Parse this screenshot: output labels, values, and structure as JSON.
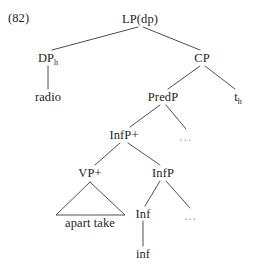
{
  "figure": {
    "example_number": "(82)",
    "width": 258,
    "height": 269,
    "type": "syntax-tree-diagram"
  },
  "nodes": {
    "root": {
      "label": "LP(dp)",
      "x": 140,
      "y": 19
    },
    "dp": {
      "label": "DP",
      "subscript": "h",
      "x": 48,
      "y": 58
    },
    "cp": {
      "label": "CP",
      "x": 202,
      "y": 58
    },
    "radio": {
      "label": "radio",
      "x": 48,
      "y": 97
    },
    "predp": {
      "label": "PredP",
      "x": 163,
      "y": 97
    },
    "trace": {
      "label": "t",
      "subscript": "h",
      "x": 238,
      "y": 97
    },
    "infp_plus": {
      "label": "InfP+",
      "x": 124,
      "y": 135
    },
    "ellipsis_predp": {
      "label": "…",
      "x": 186,
      "y": 137
    },
    "vp_plus": {
      "label": "VP+",
      "x": 90,
      "y": 173
    },
    "infp": {
      "label": "InfP",
      "x": 163,
      "y": 173
    },
    "apart_take": {
      "label": "apart take",
      "x": 90,
      "y": 223
    },
    "inf_head": {
      "label": "Inf",
      "x": 143,
      "y": 214
    },
    "ellipsis_infp": {
      "label": "…",
      "x": 191,
      "y": 216
    },
    "inf_terminal": {
      "label": "inf",
      "x": 143,
      "y": 254
    }
  },
  "edges": [
    {
      "from": "root",
      "to": "dp"
    },
    {
      "from": "root",
      "to": "cp"
    },
    {
      "from": "dp",
      "to": "radio"
    },
    {
      "from": "cp",
      "to": "predp"
    },
    {
      "from": "cp",
      "to": "trace"
    },
    {
      "from": "predp",
      "to": "infp_plus"
    },
    {
      "from": "predp",
      "to": "ellipsis_predp"
    },
    {
      "from": "infp_plus",
      "to": "vp_plus"
    },
    {
      "from": "infp_plus",
      "to": "infp"
    },
    {
      "from": "infp",
      "to": "inf_head"
    },
    {
      "from": "infp",
      "to": "ellipsis_infp"
    },
    {
      "from": "inf_head",
      "to": "inf_terminal"
    }
  ],
  "triangle": {
    "parent": "vp_plus",
    "covers": "apart take",
    "apex_x": 90,
    "apex_y": 182,
    "left_x": 56,
    "left_y": 215,
    "right_x": 125,
    "right_y": 215
  }
}
